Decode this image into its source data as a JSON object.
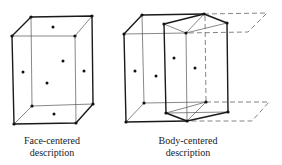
{
  "figure": {
    "type": "crystal-lattice-unit-cells",
    "colors": {
      "line": "#1a1a1a",
      "thin_line": "#555555",
      "dashed": "#666666",
      "background": "#ffffff"
    }
  },
  "panels": [
    {
      "id": "face-centered",
      "caption_line1": "Face-centered",
      "caption_line2": "description"
    },
    {
      "id": "body-centered",
      "caption_line1": "Body-centered",
      "caption_line2": "description"
    }
  ]
}
